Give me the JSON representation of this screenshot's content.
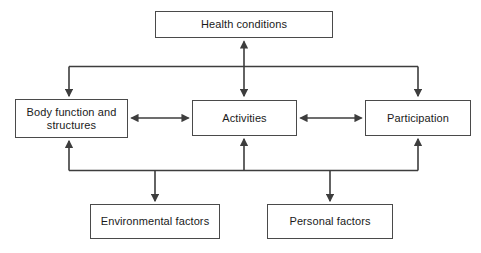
{
  "diagram": {
    "type": "flowchart",
    "stroke_color": "#3d3d3d",
    "box_border_color": "#4a4a4a",
    "background_color": "#ffffff",
    "text_color": "#1a1a1a",
    "nodes": [
      {
        "id": "health",
        "label": "Health conditions",
        "row": "top"
      },
      {
        "id": "body",
        "label": "Body function and\nstructures",
        "row": "middle"
      },
      {
        "id": "activities",
        "label": "Activities",
        "row": "middle"
      },
      {
        "id": "participation",
        "label": "Participation",
        "row": "middle"
      },
      {
        "id": "environment",
        "label": "Environmental factors",
        "row": "bottom"
      },
      {
        "id": "personal",
        "label": "Personal factors",
        "row": "bottom"
      }
    ],
    "connections": [
      {
        "from": "health",
        "to": "body",
        "arrow": "single-down",
        "via": "top-bracket"
      },
      {
        "from": "health",
        "to": "activities",
        "arrow": "double-vertical"
      },
      {
        "from": "health",
        "to": "participation",
        "arrow": "single-down",
        "via": "top-bracket"
      },
      {
        "from": "body",
        "to": "activities",
        "arrow": "double-horizontal"
      },
      {
        "from": "activities",
        "to": "participation",
        "arrow": "double-horizontal"
      },
      {
        "from": "environment",
        "to": "body",
        "arrow": "single-up",
        "via": "bottom-bracket"
      },
      {
        "from": "environment",
        "to": "activities",
        "arrow": "single-up",
        "via": "bottom-bracket"
      },
      {
        "from": "environment",
        "to": "participation",
        "arrow": "single-up",
        "via": "bottom-bracket"
      },
      {
        "from": "bottom-bracket",
        "to": "environment",
        "arrow": "single-down"
      },
      {
        "from": "bottom-bracket",
        "to": "personal",
        "arrow": "single-down"
      }
    ]
  }
}
